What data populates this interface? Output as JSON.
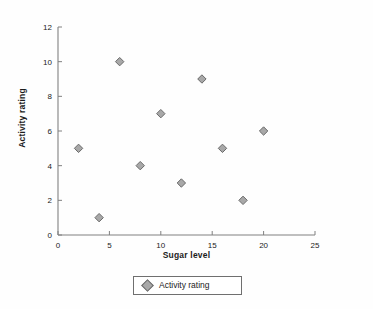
{
  "chart_data": {
    "type": "scatter",
    "title": "",
    "xlabel": "Sugar level",
    "ylabel": "Activity rating",
    "xlim": [
      0,
      25
    ],
    "ylim": [
      0,
      12
    ],
    "xticks": [
      0,
      5,
      10,
      15,
      20,
      25
    ],
    "yticks": [
      0,
      2,
      4,
      6,
      8,
      10,
      12
    ],
    "grid": false,
    "legend": {
      "position": "bottom-center",
      "entries": [
        {
          "label": "Activity rating",
          "marker": "diamond",
          "color": "#a8a8a8"
        }
      ]
    },
    "series": [
      {
        "name": "Activity rating",
        "marker": "diamond",
        "color": "#a8a8a8",
        "edge_color": "#6a6a6a",
        "points": [
          {
            "x": 2,
            "y": 5
          },
          {
            "x": 4,
            "y": 1
          },
          {
            "x": 6,
            "y": 10
          },
          {
            "x": 8,
            "y": 4
          },
          {
            "x": 10,
            "y": 7
          },
          {
            "x": 12,
            "y": 3
          },
          {
            "x": 14,
            "y": 9
          },
          {
            "x": 16,
            "y": 5
          },
          {
            "x": 18,
            "y": 2
          },
          {
            "x": 20,
            "y": 6
          }
        ]
      }
    ]
  },
  "axes": {
    "x_title": "Sugar level",
    "y_title": "Activity rating",
    "x_tick_labels": [
      "0",
      "5",
      "10",
      "15",
      "20",
      "25"
    ],
    "y_tick_labels": [
      "0",
      "2",
      "4",
      "6",
      "8",
      "10",
      "12"
    ]
  },
  "legend": {
    "entry_label": "Activity rating"
  },
  "colors": {
    "marker_fill": "#a8a8a8",
    "marker_edge": "#6a6a6a",
    "axis_line": "#808080",
    "text": "#1c1c1c",
    "background": "#fefefe"
  }
}
